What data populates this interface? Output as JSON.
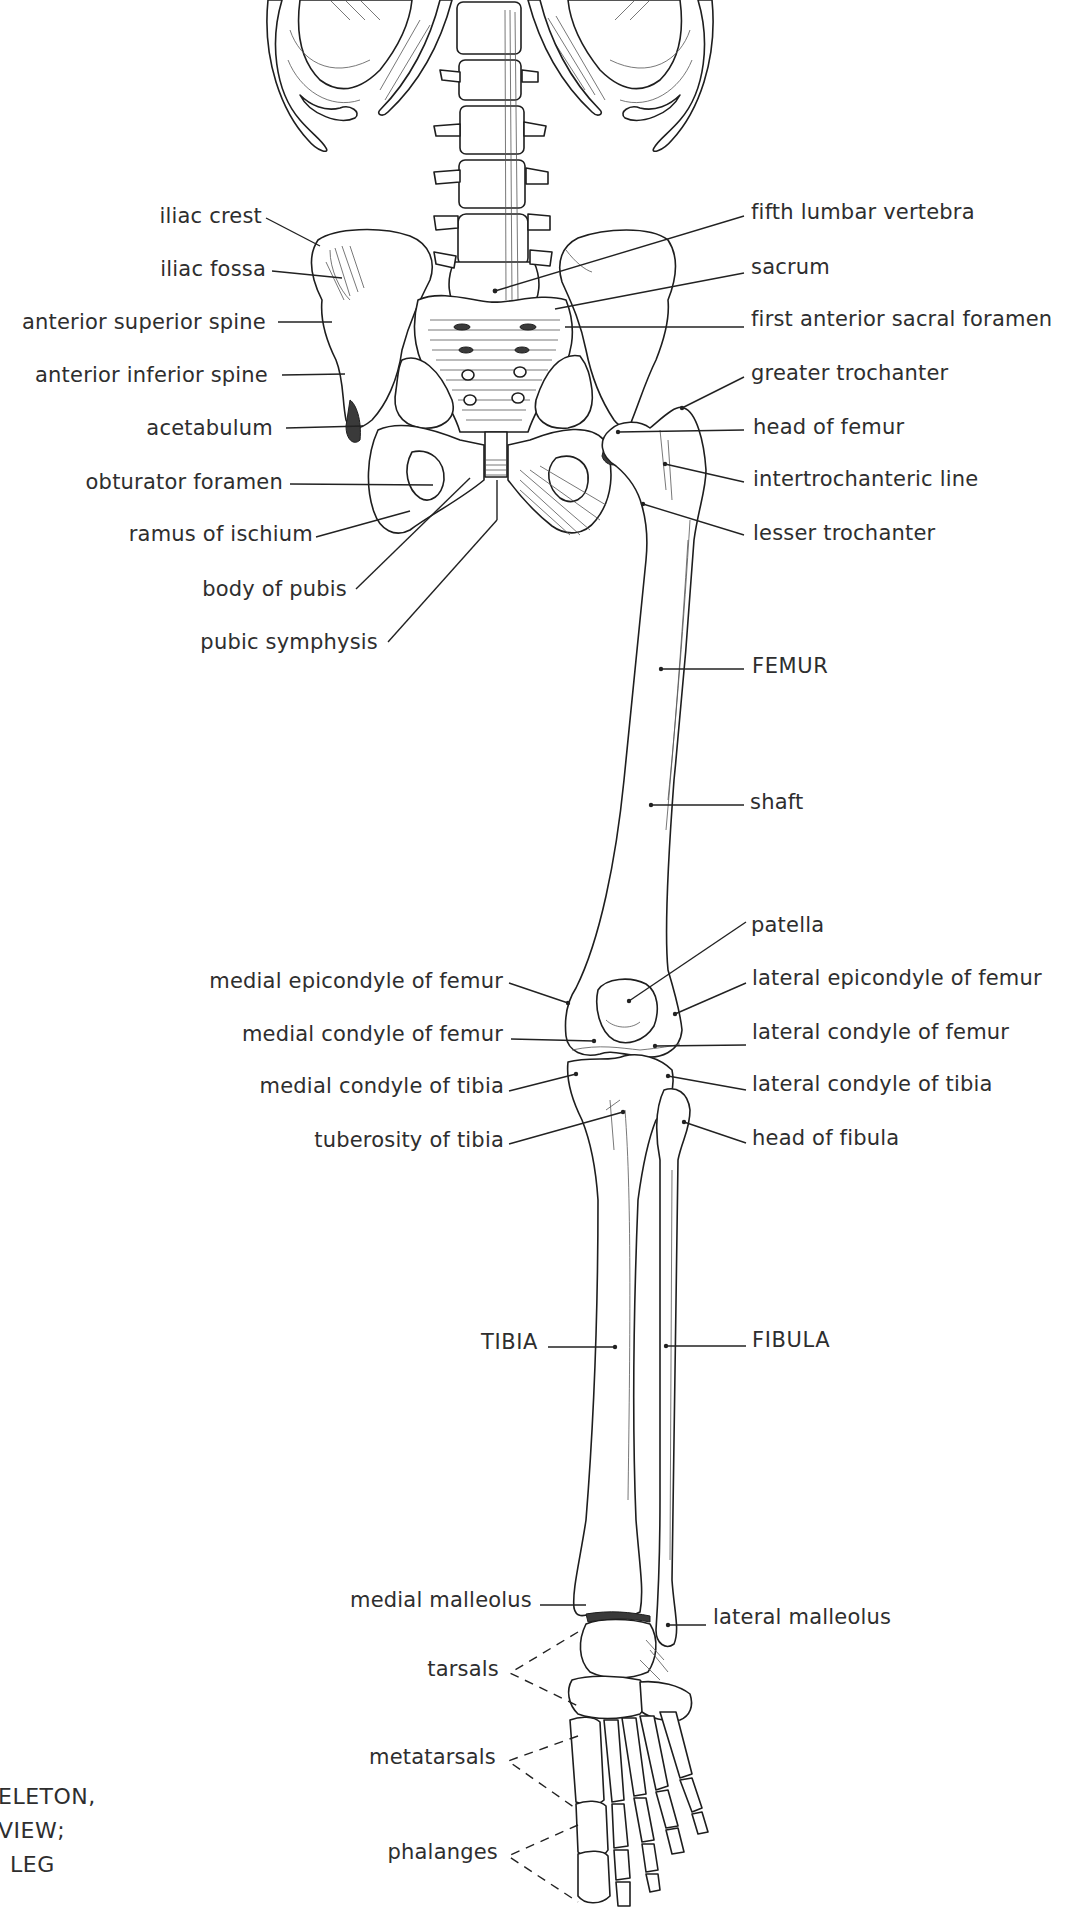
{
  "figure": {
    "title_fragment": [
      "ELETON,",
      "VIEW;",
      "LEG"
    ],
    "line_color": "#222222",
    "text_color": "#2e2e2e",
    "background": "#ffffff"
  },
  "labels": {
    "left": [
      {
        "id": "iliac-crest",
        "text": "iliac crest",
        "y": 203,
        "right": 262
      },
      {
        "id": "iliac-fossa",
        "text": "iliac fossa",
        "y": 256,
        "right": 266
      },
      {
        "id": "anterior-superior-spine",
        "text": "anterior superior spine",
        "y": 309,
        "right": 266
      },
      {
        "id": "anterior-inferior-spine",
        "text": "anterior inferior spine",
        "y": 362,
        "right": 268
      },
      {
        "id": "acetabulum",
        "text": "acetabulum",
        "y": 415,
        "right": 273
      },
      {
        "id": "obturator-foramen",
        "text": "obturator foramen",
        "y": 469,
        "right": 283
      },
      {
        "id": "ramus-of-ischium",
        "text": "ramus of ischium",
        "y": 521,
        "right": 313
      },
      {
        "id": "body-of-pubis",
        "text": "body of pubis",
        "y": 576,
        "right": 347
      },
      {
        "id": "pubic-symphysis",
        "text": "pubic symphysis",
        "y": 629,
        "right": 378
      },
      {
        "id": "medial-epicondyle-of-femur",
        "text": "medial epicondyle of femur",
        "y": 968,
        "right": 503
      },
      {
        "id": "medial-condyle-of-femur",
        "text": "medial condyle of femur",
        "y": 1021,
        "right": 503
      },
      {
        "id": "medial-condyle-of-tibia",
        "text": "medial condyle of tibia",
        "y": 1073,
        "right": 504
      },
      {
        "id": "tuberosity-of-tibia",
        "text": "tuberosity of tibia",
        "y": 1127,
        "right": 504
      },
      {
        "id": "tibia",
        "text": "TIBIA",
        "y": 1329,
        "right": 538,
        "caps": true
      },
      {
        "id": "medial-malleolus",
        "text": "medial malleolus",
        "y": 1587,
        "right": 532
      },
      {
        "id": "tarsals",
        "text": "tarsals",
        "y": 1656,
        "right": 499
      },
      {
        "id": "metatarsals",
        "text": "metatarsals",
        "y": 1744,
        "right": 496
      },
      {
        "id": "phalanges",
        "text": "phalanges",
        "y": 1839,
        "right": 498
      }
    ],
    "right": [
      {
        "id": "fifth-lumbar-vertebra",
        "text": "fifth lumbar vertebra",
        "y": 199,
        "left": 751
      },
      {
        "id": "sacrum",
        "text": "sacrum",
        "y": 254,
        "left": 751
      },
      {
        "id": "first-anterior-sacral-foramen",
        "text": "first anterior sacral foramen",
        "y": 306,
        "left": 751
      },
      {
        "id": "greater-trochanter",
        "text": "greater trochanter",
        "y": 360,
        "left": 751
      },
      {
        "id": "head-of-femur",
        "text": "head of femur",
        "y": 414,
        "left": 753
      },
      {
        "id": "intertrochanteric-line",
        "text": "intertrochanteric line",
        "y": 466,
        "left": 753
      },
      {
        "id": "lesser-trochanter",
        "text": "lesser trochanter",
        "y": 520,
        "left": 753
      },
      {
        "id": "femur",
        "text": "FEMUR",
        "y": 653,
        "left": 752,
        "caps": true
      },
      {
        "id": "shaft",
        "text": "shaft",
        "y": 789,
        "left": 750
      },
      {
        "id": "patella",
        "text": "patella",
        "y": 912,
        "left": 751
      },
      {
        "id": "lateral-epicondyle-of-femur",
        "text": "lateral epicondyle of femur",
        "y": 965,
        "left": 752
      },
      {
        "id": "lateral-condyle-of-femur",
        "text": "lateral condyle of femur",
        "y": 1019,
        "left": 752
      },
      {
        "id": "lateral-condyle-of-tibia",
        "text": "lateral condyle of tibia",
        "y": 1071,
        "left": 752
      },
      {
        "id": "head-of-fibula",
        "text": "head of fibula",
        "y": 1125,
        "left": 752
      },
      {
        "id": "fibula",
        "text": "FIBULA",
        "y": 1327,
        "left": 752,
        "caps": true
      },
      {
        "id": "lateral-malleolus",
        "text": "lateral malleolus",
        "y": 1604,
        "left": 713
      }
    ]
  },
  "leaders": [
    {
      "for": "iliac-crest",
      "x1": 266,
      "y1": 218,
      "x2": 320,
      "y2": 246
    },
    {
      "for": "iliac-fossa",
      "x1": 272,
      "y1": 271,
      "x2": 342,
      "y2": 278
    },
    {
      "for": "anterior-superior-spine",
      "x1": 278,
      "y1": 322,
      "x2": 332,
      "y2": 322
    },
    {
      "for": "anterior-inferior-spine",
      "x1": 282,
      "y1": 375,
      "x2": 345,
      "y2": 374
    },
    {
      "for": "acetabulum",
      "x1": 286,
      "y1": 428,
      "x2": 363,
      "y2": 426
    },
    {
      "for": "obturator-foramen",
      "x1": 290,
      "y1": 484,
      "x2": 433,
      "y2": 485
    },
    {
      "for": "ramus-of-ischium",
      "x1": 316,
      "y1": 537,
      "x2": 410,
      "y2": 511
    },
    {
      "for": "body-of-pubis",
      "x1": 356,
      "y1": 589,
      "x2": 470,
      "y2": 478
    },
    {
      "for": "pubic-symphysis",
      "x1": 388,
      "y1": 642,
      "x2": 497,
      "y2": 520
    },
    {
      "for": "pubic-symphysis-vert",
      "x1": 497,
      "y1": 520,
      "x2": 497,
      "y2": 480
    },
    {
      "for": "fifth-lumbar-vertebra",
      "x1": 744,
      "y1": 216,
      "x2": 495,
      "y2": 291
    },
    {
      "for": "sacrum",
      "x1": 744,
      "y1": 273,
      "x2": 555,
      "y2": 309
    },
    {
      "for": "first-anterior-sacral-foramen",
      "x1": 744,
      "y1": 327,
      "x2": 565,
      "y2": 327
    },
    {
      "for": "greater-trochanter",
      "x1": 744,
      "y1": 377,
      "x2": 682,
      "y2": 408
    },
    {
      "for": "head-of-femur",
      "x1": 744,
      "y1": 430,
      "x2": 618,
      "y2": 432
    },
    {
      "for": "intertrochanteric-line",
      "x1": 744,
      "y1": 482,
      "x2": 665,
      "y2": 464
    },
    {
      "for": "lesser-trochanter",
      "x1": 744,
      "y1": 535,
      "x2": 643,
      "y2": 504
    },
    {
      "for": "femur",
      "x1": 744,
      "y1": 669,
      "x2": 661,
      "y2": 669
    },
    {
      "for": "shaft",
      "x1": 744,
      "y1": 805,
      "x2": 651,
      "y2": 805
    },
    {
      "for": "patella",
      "x1": 746,
      "y1": 922,
      "x2": 629,
      "y2": 1001
    },
    {
      "for": "lateral-epicondyle-of-femur",
      "x1": 746,
      "y1": 983,
      "x2": 675,
      "y2": 1014
    },
    {
      "for": "lateral-condyle-of-femur",
      "x1": 746,
      "y1": 1045,
      "x2": 655,
      "y2": 1046
    },
    {
      "for": "lateral-condyle-of-tibia",
      "x1": 746,
      "y1": 1090,
      "x2": 668,
      "y2": 1076
    },
    {
      "for": "head-of-fibula",
      "x1": 746,
      "y1": 1143,
      "x2": 684,
      "y2": 1122
    },
    {
      "for": "fibula",
      "x1": 746,
      "y1": 1346,
      "x2": 666,
      "y2": 1346
    },
    {
      "for": "lateral-malleolus",
      "x1": 706,
      "y1": 1625,
      "x2": 668,
      "y2": 1625
    },
    {
      "for": "medial-epicondyle-of-femur",
      "x1": 509,
      "y1": 983,
      "x2": 568,
      "y2": 1003
    },
    {
      "for": "medial-condyle-of-femur",
      "x1": 511,
      "y1": 1039,
      "x2": 594,
      "y2": 1041
    },
    {
      "for": "medial-condyle-of-tibia",
      "x1": 509,
      "y1": 1091,
      "x2": 576,
      "y2": 1074
    },
    {
      "for": "tuberosity-of-tibia",
      "x1": 509,
      "y1": 1144,
      "x2": 623,
      "y2": 1112
    },
    {
      "for": "tibia",
      "x1": 548,
      "y1": 1347,
      "x2": 615,
      "y2": 1347
    },
    {
      "for": "medial-malleolus",
      "x1": 540,
      "y1": 1605,
      "x2": 586,
      "y2": 1605
    }
  ],
  "dashed_leaders": [
    {
      "for": "tarsals",
      "points": [
        [
          578,
          1632
        ],
        [
          510,
          1673
        ],
        [
          578,
          1706
        ]
      ]
    },
    {
      "for": "metatarsals",
      "points": [
        [
          578,
          1736
        ],
        [
          508,
          1761
        ],
        [
          578,
          1810
        ]
      ]
    },
    {
      "for": "phalanges",
      "points": [
        [
          578,
          1825
        ],
        [
          508,
          1856
        ],
        [
          578,
          1902
        ]
      ]
    }
  ]
}
